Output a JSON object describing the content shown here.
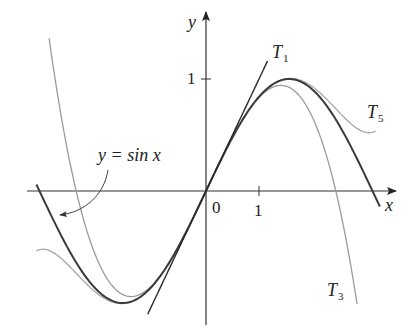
{
  "diagram": {
    "axes": {
      "x_label": "x",
      "y_label": "y",
      "origin_label": "0",
      "x_tick_label": "1",
      "y_tick_label": "1"
    },
    "curves": [
      {
        "name": "sin",
        "label": "y = sin x",
        "terms": "sin",
        "color": "#3a3a3a",
        "width": 2.0,
        "x_range": [
          -3.2,
          3.28
        ]
      },
      {
        "name": "T1",
        "label": "T",
        "sub": "1",
        "coeffs": [
          0,
          1
        ],
        "color": "#2a2a2a",
        "width": 1.4,
        "x_range": [
          -1.1,
          1.16
        ]
      },
      {
        "name": "T3",
        "label": "T",
        "sub": "3",
        "coeffs": [
          0,
          1,
          0,
          -0.16666667
        ],
        "color": "#9a9a9a",
        "width": 1.3,
        "x_range": [
          -2.96,
          2.85
        ]
      },
      {
        "name": "T5",
        "label": "T",
        "sub": "5",
        "coeffs": [
          0,
          1,
          0,
          -0.16666667,
          0,
          0.00833333
        ],
        "color": "#a8a8a8",
        "width": 1.3,
        "x_range": [
          -3.2,
          3.2
        ]
      }
    ],
    "annotation": {
      "text": "y = sin x",
      "arrow": "curved arrow pointing to sin curve"
    }
  },
  "layout": {
    "origin_px": [
      206,
      191
    ],
    "x_unit_px": 53,
    "y_unit_px": 112,
    "x_axis_px": [
      27,
      396
    ],
    "y_axis_px": [
      12,
      325
    ]
  }
}
